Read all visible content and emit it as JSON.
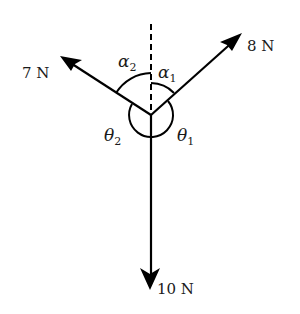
{
  "diagram": {
    "type": "force-diagram",
    "origin": {
      "x": 151,
      "y": 115
    },
    "reference_line": {
      "style": "dashed",
      "direction": "vertical-up"
    },
    "forces": [
      {
        "id": "f8",
        "label": "8 N",
        "magnitude": 8,
        "unit": "N",
        "direction": "up-right"
      },
      {
        "id": "f7",
        "label": "7 N",
        "magnitude": 7,
        "unit": "N",
        "direction": "up-left"
      },
      {
        "id": "f10",
        "label": "10 N",
        "magnitude": 10,
        "unit": "N",
        "direction": "down"
      }
    ],
    "angles": [
      {
        "id": "alpha1",
        "symbol": "α",
        "subscript": "1",
        "between": [
          "vertical",
          "8 N"
        ]
      },
      {
        "id": "alpha2",
        "symbol": "α",
        "subscript": "2",
        "between": [
          "vertical",
          "7 N"
        ]
      },
      {
        "id": "theta1",
        "symbol": "θ",
        "subscript": "1",
        "between": [
          "8 N",
          "10 N"
        ]
      },
      {
        "id": "theta2",
        "symbol": "θ",
        "subscript": "2",
        "between": [
          "7 N",
          "10 N"
        ]
      }
    ],
    "colors": {
      "stroke": "#000000",
      "text": "#1a1a1a",
      "background": "#ffffff"
    }
  }
}
